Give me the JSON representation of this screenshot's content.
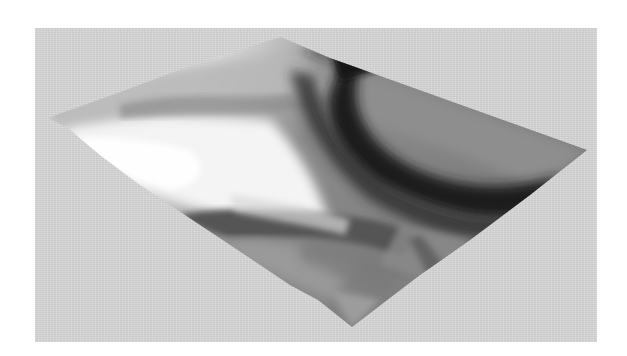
{
  "figure": {
    "background_color": "#d6d6d6",
    "page_color": "#ffffff",
    "surface": {
      "vertices": {
        "top": [
          281,
          37
        ],
        "right": [
          587,
          150
        ],
        "bottom": [
          352,
          327
        ],
        "left": [
          47,
          118
        ]
      },
      "tones": {
        "lightest": "#f4f4f4",
        "light": "#d9d9d9",
        "mid": "#9a9a9a",
        "dark": "#3a3a3a",
        "darkest": "#141414"
      }
    }
  }
}
